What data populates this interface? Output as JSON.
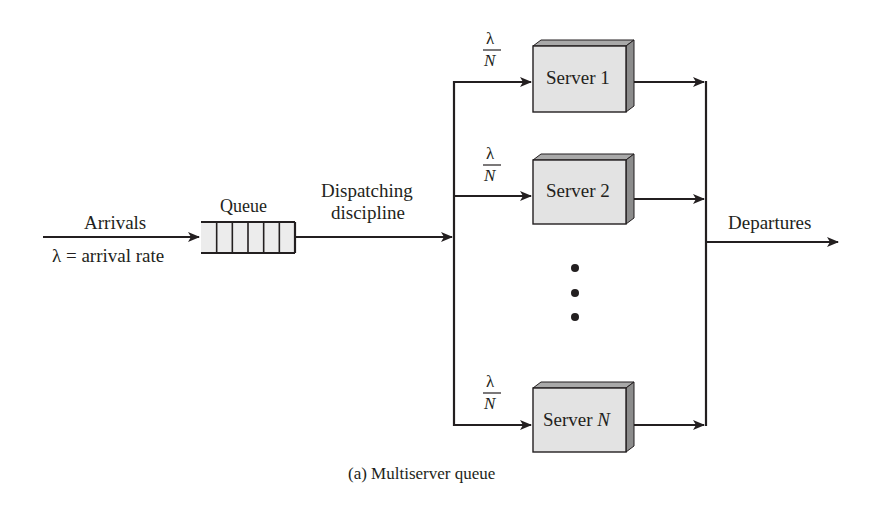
{
  "diagram": {
    "caption": "(a) Multiserver queue",
    "arrivals": {
      "label": "Arrivals",
      "rate_label": "λ = arrival rate"
    },
    "queue": {
      "label": "Queue",
      "slots": 6
    },
    "dispatcher": {
      "label_line1": "Dispatching",
      "label_line2": "discipline"
    },
    "departures": {
      "label": "Departures"
    },
    "servers": [
      {
        "name": "Server 1",
        "prefix": "Server",
        "suffix": "1",
        "italic_suffix": false,
        "rate_num": "λ",
        "rate_den": "N"
      },
      {
        "name": "Server 2",
        "prefix": "Server",
        "suffix": "2",
        "italic_suffix": false,
        "rate_num": "λ",
        "rate_den": "N"
      },
      {
        "name": "Server N",
        "prefix": "Server",
        "suffix": "N",
        "italic_suffix": true,
        "rate_num": "λ",
        "rate_den": "N"
      }
    ],
    "ellipsis": "⋮",
    "colors": {
      "ink": "#231f20",
      "box_fill": "#e3e3e3",
      "box_top": "#a9a9a9",
      "box_side": "#8c8c8c",
      "queue_fill": "#ececec"
    }
  }
}
